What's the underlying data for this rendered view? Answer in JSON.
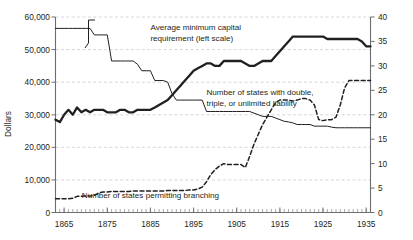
{
  "chart_data": {
    "type": "line",
    "title": "",
    "subtitle": "",
    "xlabel": "",
    "ylabel": "Dollars",
    "y2label": "",
    "xlim": [
      1863,
      1936
    ],
    "ylim": [
      0,
      60000
    ],
    "y2lim": [
      0,
      40
    ],
    "grid": true,
    "grid_axis": "y",
    "legend_position": "inline-annotations",
    "x_tick_labels": [
      "1865",
      "1875",
      "1885",
      "1895",
      "1905",
      "1915",
      "1925",
      "1935"
    ],
    "x_tick_values": [
      1865,
      1875,
      1885,
      1895,
      1905,
      1915,
      1925,
      1935
    ],
    "x_minor_tick_interval": 1,
    "y_tick_labels": [
      "0",
      "10,000",
      "20,000",
      "30,000",
      "40,000",
      "50,000",
      "60,000"
    ],
    "y_tick_values": [
      0,
      10000,
      20000,
      30000,
      40000,
      50000,
      60000
    ],
    "y2_tick_labels": [
      "0",
      "5",
      "10",
      "15",
      "20",
      "25",
      "30",
      "35",
      "40"
    ],
    "y2_tick_values": [
      0,
      5,
      10,
      15,
      20,
      25,
      30,
      35,
      40
    ],
    "annotations": [
      {
        "name": "capital-requirement-label",
        "lines": [
          "Average minimum capital",
          "requirement (left scale)"
        ],
        "x": 1885,
        "y": 56000
      },
      {
        "name": "double-liability-label",
        "lines": [
          "Number of states with double,",
          "triple, or unlimited liability"
        ],
        "x": 1898,
        "y": 36000
      },
      {
        "name": "branching-label",
        "lines": [
          "Number of states permitting branching"
        ],
        "x": 1885,
        "y": 4500
      }
    ],
    "series": [
      {
        "name": "Average minimum capital requirement",
        "axis": "left",
        "style": "solid-thin",
        "color": "#231f20",
        "x": [
          1863,
          1864,
          1865,
          1866,
          1867,
          1868,
          1869,
          1870,
          1871,
          1872,
          1873,
          1874,
          1875,
          1876,
          1877,
          1878,
          1879,
          1880,
          1881,
          1882,
          1883,
          1884,
          1885,
          1886,
          1887,
          1888,
          1889,
          1890,
          1891,
          1892,
          1893,
          1894,
          1895,
          1896,
          1897,
          1898,
          1899,
          1900,
          1901,
          1902,
          1903,
          1904,
          1905,
          1906,
          1907,
          1908,
          1909,
          1910,
          1911,
          1912,
          1913,
          1914,
          1915,
          1916,
          1917,
          1918,
          1919,
          1920,
          1921,
          1922,
          1923,
          1924,
          1925,
          1926,
          1927,
          1928,
          1929,
          1930,
          1931,
          1932,
          1933,
          1934,
          1935,
          1936
        ],
        "values": [
          56500,
          56500,
          56500,
          56500,
          56500,
          56500,
          56500,
          56500,
          56500,
          54500,
          54500,
          54500,
          54500,
          46500,
          46500,
          46500,
          46500,
          46500,
          46500,
          45500,
          43500,
          43500,
          43500,
          40500,
          40500,
          40500,
          40000,
          36500,
          34500,
          34500,
          34500,
          34500,
          34500,
          34500,
          34500,
          31000,
          31000,
          31000,
          31000,
          31000,
          31000,
          31000,
          31000,
          31000,
          31000,
          31000,
          30500,
          30000,
          29500,
          29500,
          29500,
          29000,
          28500,
          28000,
          27800,
          27500,
          27000,
          27000,
          27000,
          27000,
          26500,
          26500,
          26500,
          26500,
          26200,
          26000,
          26000,
          26000,
          26000,
          26000,
          26000,
          26000,
          26000,
          26000
        ]
      },
      {
        "name": "Number of states with double, triple, or unlimited liability",
        "axis": "right",
        "style": "solid-thick",
        "color": "#231f20",
        "x": [
          1863,
          1864,
          1865,
          1866,
          1867,
          1868,
          1869,
          1870,
          1871,
          1872,
          1873,
          1874,
          1875,
          1876,
          1877,
          1878,
          1879,
          1880,
          1881,
          1882,
          1883,
          1884,
          1885,
          1886,
          1887,
          1888,
          1889,
          1890,
          1891,
          1892,
          1893,
          1894,
          1895,
          1896,
          1897,
          1898,
          1899,
          1900,
          1901,
          1902,
          1903,
          1904,
          1905,
          1906,
          1907,
          1908,
          1909,
          1910,
          1911,
          1912,
          1913,
          1914,
          1915,
          1916,
          1917,
          1918,
          1919,
          1920,
          1921,
          1922,
          1923,
          1924,
          1925,
          1926,
          1927,
          1928,
          1929,
          1930,
          1931,
          1932,
          1933,
          1934,
          1935,
          1936
        ],
        "values": [
          19,
          18.5,
          20,
          21,
          20,
          21.5,
          20.5,
          21,
          20.5,
          21,
          21,
          21,
          20.5,
          20.5,
          20.5,
          21,
          21,
          20.5,
          20.5,
          21,
          21,
          21,
          21,
          21.5,
          22,
          22.5,
          23,
          24,
          25,
          26,
          27,
          28,
          29,
          29.5,
          30,
          30.5,
          30.5,
          30,
          30,
          31,
          31,
          31,
          31,
          31,
          30.5,
          30,
          30,
          30.5,
          31,
          31,
          31,
          32,
          33,
          34,
          35,
          36,
          36,
          36,
          36,
          36,
          36,
          36,
          36,
          35.5,
          35.5,
          35.5,
          35.5,
          35.5,
          35.5,
          35.5,
          35.5,
          35,
          34,
          34
        ]
      },
      {
        "name": "Number of states permitting branching",
        "axis": "right",
        "style": "dashed",
        "color": "#231f20",
        "x": [
          1863,
          1864,
          1865,
          1866,
          1867,
          1868,
          1869,
          1870,
          1871,
          1872,
          1873,
          1874,
          1875,
          1876,
          1877,
          1878,
          1879,
          1880,
          1881,
          1882,
          1883,
          1884,
          1885,
          1886,
          1887,
          1888,
          1889,
          1890,
          1891,
          1892,
          1893,
          1894,
          1895,
          1896,
          1897,
          1898,
          1899,
          1900,
          1901,
          1902,
          1903,
          1904,
          1905,
          1906,
          1907,
          1908,
          1909,
          1910,
          1911,
          1912,
          1913,
          1914,
          1915,
          1916,
          1917,
          1918,
          1919,
          1920,
          1921,
          1922,
          1923,
          1924,
          1925,
          1926,
          1927,
          1928,
          1929,
          1930,
          1931,
          1932,
          1933,
          1934,
          1935,
          1936
        ],
        "values": [
          2.8,
          2.8,
          2.8,
          2.8,
          2.9,
          3.3,
          3.3,
          3.4,
          3.4,
          3.5,
          4,
          4.2,
          4.2,
          4.3,
          4.3,
          4.3,
          4.3,
          4.3,
          4.4,
          4.4,
          4.4,
          4.4,
          4.4,
          4.4,
          4.4,
          4.4,
          4.5,
          4.5,
          4.5,
          4.5,
          4.5,
          4.6,
          4.6,
          4.8,
          5.2,
          6.3,
          7.8,
          8.8,
          9.5,
          10,
          9.8,
          9.8,
          9.8,
          9.8,
          9.2,
          11.5,
          14,
          16,
          18,
          19.5,
          21,
          22.5,
          23,
          23,
          23,
          22.8,
          23,
          23.3,
          23.3,
          23,
          22,
          19,
          18.8,
          19,
          19,
          19.5,
          22,
          25.5,
          27,
          27,
          27,
          27,
          27,
          27
        ]
      }
    ]
  },
  "axes": {
    "left_title": "Dollars"
  }
}
